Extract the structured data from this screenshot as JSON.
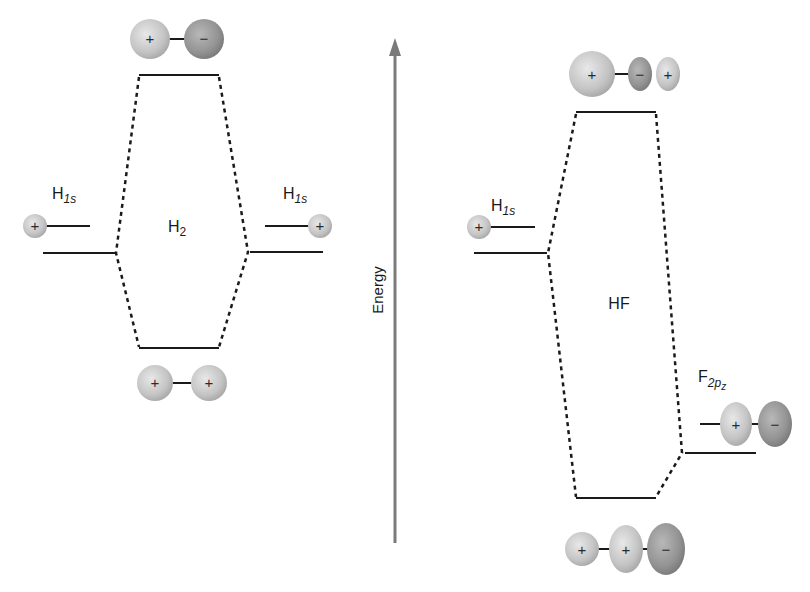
{
  "diagram": {
    "type": "molecular-orbital-energy-diagram",
    "axis": {
      "label": "Energy",
      "direction": "up",
      "color": "#7a7a7a"
    },
    "h2": {
      "title": "H",
      "title_sub": "2",
      "left_ao": {
        "label": "H",
        "label_sub": "1s",
        "orbital_sign": "+"
      },
      "right_ao": {
        "label": "H",
        "label_sub": "1s",
        "orbital_sign": "+"
      },
      "antibonding_mo": {
        "signs": [
          "+",
          "−"
        ]
      },
      "bonding_mo": {
        "signs": [
          "+",
          "+"
        ]
      }
    },
    "hf": {
      "title": "HF",
      "left_ao": {
        "label": "H",
        "label_sub": "1s",
        "orbital_sign": "+"
      },
      "right_ao": {
        "label": "F",
        "label_sub": "2p",
        "label_subsub": "z",
        "orbital_signs": [
          "+",
          "−"
        ]
      },
      "antibonding_mo": {
        "signs": [
          "+",
          "−",
          "+"
        ]
      },
      "bonding_mo": {
        "signs": [
          "+",
          "+",
          "−"
        ]
      }
    },
    "colors": {
      "orbital_light": "#d4d4d4",
      "orbital_dark": "#9a9a9a",
      "line": "#1a1a1a"
    }
  }
}
